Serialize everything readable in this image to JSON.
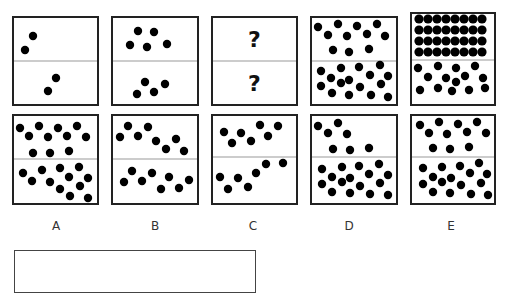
{
  "puzzle": {
    "dot_radius": 4.2,
    "line_color": "#222222",
    "divider_color": "#999999",
    "dot_color": "#000000",
    "question_mark": "?",
    "question_boxes": [
      {
        "id": "q1",
        "x": 13,
        "y": 17,
        "w": 85,
        "h": 88,
        "divider_y": 61,
        "dots": [
          [
            33,
            36
          ],
          [
            25,
            50
          ],
          [
            56,
            78
          ],
          [
            48,
            91
          ]
        ]
      },
      {
        "id": "q2",
        "x": 112,
        "y": 17,
        "w": 86,
        "h": 88,
        "divider_y": 61,
        "dots": [
          [
            138,
            31
          ],
          [
            154,
            32
          ],
          [
            130,
            45
          ],
          [
            147,
            47
          ],
          [
            167,
            44
          ],
          [
            145,
            82
          ],
          [
            165,
            84
          ],
          [
            137,
            94
          ],
          [
            154,
            92
          ]
        ]
      },
      {
        "id": "q3",
        "x": 212,
        "y": 17,
        "w": 85,
        "h": 88,
        "divider_y": 61,
        "unknown": true,
        "dots": []
      },
      {
        "id": "q4",
        "x": 311,
        "y": 17,
        "w": 86,
        "h": 88,
        "divider_y": 61,
        "dots": [
          [
            318,
            27
          ],
          [
            338,
            24
          ],
          [
            357,
            26
          ],
          [
            377,
            24
          ],
          [
            328,
            35
          ],
          [
            347,
            36
          ],
          [
            367,
            34
          ],
          [
            385,
            36
          ],
          [
            333,
            50
          ],
          [
            349,
            52
          ],
          [
            369,
            49
          ],
          [
            321,
            71
          ],
          [
            341,
            68
          ],
          [
            359,
            67
          ],
          [
            380,
            65
          ],
          [
            331,
            78
          ],
          [
            349,
            80
          ],
          [
            370,
            75
          ],
          [
            388,
            76
          ],
          [
            321,
            86
          ],
          [
            341,
            83
          ],
          [
            360,
            87
          ],
          [
            381,
            84
          ],
          [
            332,
            93
          ],
          [
            349,
            95
          ],
          [
            371,
            95
          ],
          [
            388,
            97
          ]
        ]
      },
      {
        "id": "q5",
        "x": 411,
        "y": 13,
        "w": 84,
        "h": 92,
        "divider_y": 60,
        "grid": {
          "cols": 8,
          "rows": 4,
          "x0": 419,
          "dx": 9,
          "ys": [
            19,
            30,
            41,
            52
          ]
        },
        "dots": [
          [
            418,
            68
          ],
          [
            438,
            66
          ],
          [
            456,
            68
          ],
          [
            475,
            66
          ],
          [
            428,
            77
          ],
          [
            446,
            78
          ],
          [
            465,
            76
          ],
          [
            483,
            78
          ],
          [
            456,
            82
          ],
          [
            420,
            90
          ],
          [
            438,
            88
          ],
          [
            452,
            91
          ],
          [
            469,
            90
          ],
          [
            485,
            88
          ]
        ]
      }
    ],
    "option_boxes": [
      {
        "id": "A",
        "x": 13,
        "y": 115,
        "w": 85,
        "h": 89,
        "divider_y": 159,
        "dots": [
          [
            20,
            128
          ],
          [
            39,
            126
          ],
          [
            58,
            128
          ],
          [
            77,
            126
          ],
          [
            29,
            136
          ],
          [
            48,
            137
          ],
          [
            67,
            136
          ],
          [
            86,
            137
          ],
          [
            33,
            153
          ],
          [
            50,
            153
          ],
          [
            69,
            151
          ],
          [
            23,
            173
          ],
          [
            42,
            170
          ],
          [
            60,
            168
          ],
          [
            79,
            167
          ],
          [
            32,
            181
          ],
          [
            50,
            182
          ],
          [
            69,
            177
          ],
          [
            88,
            178
          ],
          [
            60,
            189
          ],
          [
            80,
            186
          ],
          [
            70,
            196
          ],
          [
            88,
            198
          ]
        ]
      },
      {
        "id": "B",
        "x": 112,
        "y": 115,
        "w": 86,
        "h": 89,
        "divider_y": 159,
        "dots": [
          [
            128,
            126
          ],
          [
            148,
            127
          ],
          [
            120,
            137
          ],
          [
            138,
            136
          ],
          [
            156,
            141
          ],
          [
            176,
            139
          ],
          [
            166,
            149
          ],
          [
            184,
            151
          ],
          [
            132,
            171
          ],
          [
            152,
            173
          ],
          [
            124,
            182
          ],
          [
            142,
            181
          ],
          [
            169,
            177
          ],
          [
            189,
            180
          ],
          [
            161,
            189
          ],
          [
            179,
            188
          ]
        ]
      },
      {
        "id": "C",
        "x": 212,
        "y": 115,
        "w": 85,
        "h": 89,
        "divider_y": 157,
        "dots": [
          [
            224,
            132
          ],
          [
            241,
            133
          ],
          [
            260,
            125
          ],
          [
            278,
            126
          ],
          [
            232,
            143
          ],
          [
            251,
            141
          ],
          [
            268,
            136
          ],
          [
            283,
            163
          ],
          [
            266,
            164
          ],
          [
            256,
            173
          ],
          [
            220,
            177
          ],
          [
            238,
            178
          ],
          [
            228,
            189
          ],
          [
            248,
            187
          ]
        ]
      },
      {
        "id": "D",
        "x": 311,
        "y": 115,
        "w": 86,
        "h": 89,
        "divider_y": 157,
        "dots": [
          [
            318,
            126
          ],
          [
            338,
            123
          ],
          [
            328,
            133
          ],
          [
            347,
            134
          ],
          [
            333,
            149
          ],
          [
            350,
            150
          ],
          [
            369,
            148
          ],
          [
            322,
            169
          ],
          [
            342,
            167
          ],
          [
            359,
            166
          ],
          [
            379,
            164
          ],
          [
            332,
            177
          ],
          [
            350,
            178
          ],
          [
            369,
            174
          ],
          [
            388,
            175
          ],
          [
            322,
            184
          ],
          [
            342,
            182
          ],
          [
            360,
            186
          ],
          [
            380,
            183
          ],
          [
            332,
            192
          ],
          [
            350,
            193
          ],
          [
            370,
            194
          ],
          [
            388,
            195
          ]
        ]
      },
      {
        "id": "E",
        "x": 411,
        "y": 115,
        "w": 84,
        "h": 89,
        "divider_y": 157,
        "dots": [
          [
            420,
            125
          ],
          [
            439,
            122
          ],
          [
            458,
            124
          ],
          [
            477,
            122
          ],
          [
            429,
            133
          ],
          [
            447,
            134
          ],
          [
            467,
            132
          ],
          [
            486,
            133
          ],
          [
            433,
            148
          ],
          [
            450,
            149
          ],
          [
            469,
            147
          ],
          [
            423,
            168
          ],
          [
            442,
            167
          ],
          [
            460,
            166
          ],
          [
            479,
            163
          ],
          [
            433,
            177
          ],
          [
            451,
            178
          ],
          [
            470,
            173
          ],
          [
            487,
            174
          ],
          [
            423,
            184
          ],
          [
            442,
            182
          ],
          [
            461,
            185
          ],
          [
            481,
            183
          ],
          [
            433,
            192
          ],
          [
            450,
            193
          ],
          [
            471,
            194
          ],
          [
            488,
            195
          ]
        ]
      }
    ],
    "option_labels": [
      {
        "text": "A",
        "x": 56
      },
      {
        "text": "B",
        "x": 155
      },
      {
        "text": "C",
        "x": 253
      },
      {
        "text": "D",
        "x": 349
      },
      {
        "text": "E",
        "x": 451
      }
    ],
    "label_y": 219,
    "answer_box": {
      "value": ""
    }
  }
}
